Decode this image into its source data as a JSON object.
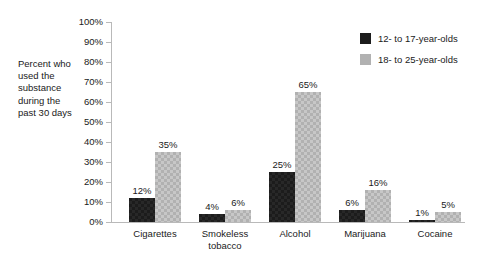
{
  "chart_data": {
    "type": "bar",
    "title": "",
    "subtitle": "",
    "xlabel": "",
    "ylabel": "Percent who used the substance during the past 30 days",
    "categories": [
      "Cigarettes",
      "Smokeless tobacco",
      "Alcohol",
      "Marijuana",
      "Cocaine"
    ],
    "series": [
      {
        "name": "12- to 17-year-olds",
        "color": "#1c1c1c",
        "values": [
          12,
          4,
          25,
          6,
          1
        ],
        "value_labels": [
          "12%",
          "4%",
          "25%",
          "6%",
          "1%"
        ]
      },
      {
        "name": "18- to 25-year-olds",
        "color": "#b1b1b1",
        "values": [
          35,
          6,
          65,
          16,
          5
        ],
        "value_labels": [
          "35%",
          "6%",
          "65%",
          "16%",
          "5%"
        ]
      }
    ],
    "ylim": [
      0,
      100
    ],
    "ytick_values": [
      0,
      10,
      20,
      30,
      40,
      50,
      60,
      70,
      80,
      90,
      100
    ],
    "ytick_labels": [
      "0%",
      "10%",
      "20%",
      "30%",
      "40%",
      "50%",
      "60%",
      "70%",
      "80%",
      "90%",
      "100%"
    ],
    "grid": false,
    "legend_position": "top-right"
  },
  "axis": {
    "y_caption": "Percent who\nused the\nsubstance\nduring the\npast 30 days"
  },
  "category_display": [
    "Cigarettes",
    "Smokeless\ntobacco",
    "Alcohol",
    "Marijuana",
    "Cocaine"
  ],
  "colors": {
    "series_0": "#1c1c1c",
    "series_1": "#b1b1b1",
    "axis_line": "#b9b9b9",
    "text": "#1a1a1a",
    "background": "#ffffff"
  }
}
